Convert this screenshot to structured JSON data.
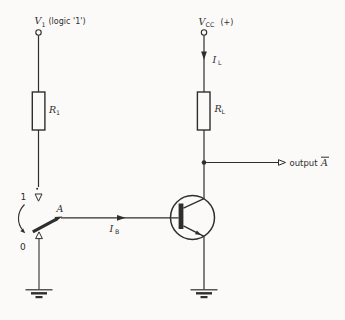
{
  "figure": {
    "kind": "transistor-inverter-circuit-diagram",
    "colors": {
      "ink": "#2e2e2e",
      "background": "#fbfaf8"
    },
    "symbols": {
      "terminal": "open-circle",
      "ground": "earth-ground",
      "current_arrow": "filled-triangle",
      "output_arrow": "open-triangle",
      "switch_contact_arrow": "open-triangle"
    }
  },
  "labels": {
    "v1": {
      "base": "V",
      "sub": "1",
      "suffix": "(logic '1')"
    },
    "vcc": {
      "base": "V",
      "sub": "CC",
      "suffix": "(+)"
    },
    "il": {
      "base": "I",
      "sub": "L"
    },
    "r1": {
      "base": "R",
      "sub": "1"
    },
    "rl": {
      "base": "R",
      "sub": "L"
    },
    "ib": {
      "base": "I",
      "sub": "B"
    },
    "switch": {
      "pos_up": "1",
      "pos_down": "0",
      "node": "A"
    },
    "output": {
      "word": "output",
      "signal": "A",
      "notation": "overline"
    }
  }
}
